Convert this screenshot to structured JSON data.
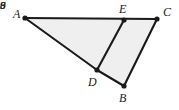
{
  "figure": {
    "type": "geometry-diagram",
    "background_color": "#ffffff",
    "fill_color": "#efefef",
    "stroke_color": "#1a1a1a",
    "vertices": [
      {
        "name": "A",
        "label": "A",
        "x": 25,
        "y": 18,
        "label_x": 13,
        "label_y": 8
      },
      {
        "name": "E",
        "label": "E",
        "x": 124,
        "y": 20,
        "label_x": 119,
        "label_y": 3
      },
      {
        "name": "C",
        "label": "C",
        "x": 157,
        "y": 19,
        "label_x": 163,
        "label_y": 6
      },
      {
        "name": "D",
        "label": "D",
        "x": 97,
        "y": 70,
        "label_x": 88,
        "label_y": 76
      },
      {
        "name": "B",
        "label": "B",
        "x": 124,
        "y": 86,
        "label_x": 119,
        "label_y": 92
      }
    ],
    "edges": [
      {
        "name": "edge-A-C",
        "from": "A",
        "to": "C"
      },
      {
        "name": "edge-A-D",
        "from": "A",
        "to": "D"
      },
      {
        "name": "edge-D-E",
        "from": "D",
        "to": "E"
      },
      {
        "name": "edge-D-B",
        "from": "D",
        "to": "B"
      },
      {
        "name": "edge-B-C",
        "from": "B",
        "to": "C"
      }
    ],
    "measure_labels": [
      {
        "name": "length-AD",
        "value": "9",
        "edge": "edge-A-D",
        "x": 50,
        "y": 46
      },
      {
        "name": "length-DE",
        "value": "6",
        "edge": "edge-D-E",
        "x": 111,
        "y": 41
      },
      {
        "name": "length-BC",
        "value": "8",
        "edge": "edge-B-C",
        "x": 144,
        "y": 49
      }
    ],
    "shaded_region": {
      "name": "polygon-A-C-B-D",
      "points": "25,18 157,19 124,86 97,70"
    }
  }
}
